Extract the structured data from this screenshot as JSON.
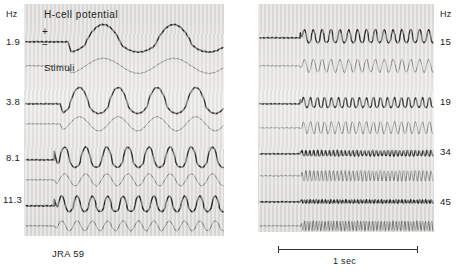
{
  "figure": {
    "title": "H-cell potential",
    "specimen_label": "JRA 59",
    "stimuli_label": "Stimuli",
    "polarity_plus": "+",
    "polarity_minus": "−",
    "scalebar_label": "1 sec"
  },
  "left_panel": {
    "axis_unit": "Hz",
    "rows": [
      {
        "hz_label": "1.9"
      },
      {
        "hz_label": "3.8"
      },
      {
        "hz_label": "8.1"
      },
      {
        "hz_label": "11.3"
      }
    ]
  },
  "right_panel": {
    "axis_unit": "Hz",
    "rows": [
      {
        "hz_label": "15"
      },
      {
        "hz_label": "19"
      },
      {
        "hz_label": "34"
      },
      {
        "hz_label": "45"
      }
    ]
  },
  "chart_data": {
    "type": "line",
    "title": "H-cell potential",
    "subtitle": "JRA 59",
    "xlabel": "time",
    "ylabel": "membrane potential / stimulus",
    "x_scalebar": {
      "label": "1 sec",
      "seconds": 1
    },
    "grid": false,
    "legend": [
      "H-cell potential (response)",
      "Stimuli"
    ],
    "legend_position": "inline-left",
    "note": "Each row is a paired recording: upper dark trace = H-cell membrane potential response, lower light trace = sinusoidal flicker stimulus. Response amplitude attenuates as stimulus frequency rises.",
    "panels": [
      {
        "name": "left",
        "axis_unit": "Hz",
        "axis_side": "left",
        "series": [
          {
            "name": "1.9 Hz response",
            "frequency_hz": 1.9,
            "role": "response",
            "relative_amplitude": 1.0,
            "cycles_visible": 2.2
          },
          {
            "name": "1.9 Hz stimulus",
            "frequency_hz": 1.9,
            "role": "stimulus",
            "relative_amplitude": 0.42,
            "cycles_visible": 2.2
          },
          {
            "name": "3.8 Hz response",
            "frequency_hz": 3.8,
            "role": "response",
            "relative_amplitude": 0.92,
            "cycles_visible": 4.2
          },
          {
            "name": "3.8 Hz stimulus",
            "frequency_hz": 3.8,
            "role": "stimulus",
            "relative_amplitude": 0.4,
            "cycles_visible": 4.2
          },
          {
            "name": "8.1 Hz response",
            "frequency_hz": 8.1,
            "role": "response",
            "relative_amplitude": 0.74,
            "cycles_visible": 8.0
          },
          {
            "name": "8.1 Hz stimulus",
            "frequency_hz": 8.1,
            "role": "stimulus",
            "relative_amplitude": 0.38,
            "cycles_visible": 8.0
          },
          {
            "name": "11.3 Hz response",
            "frequency_hz": 11.3,
            "role": "response",
            "relative_amplitude": 0.58,
            "cycles_visible": 11.0
          },
          {
            "name": "11.3 Hz stimulus",
            "frequency_hz": 11.3,
            "role": "stimulus",
            "relative_amplitude": 0.34,
            "cycles_visible": 11.0
          }
        ]
      },
      {
        "name": "right",
        "axis_unit": "Hz",
        "axis_side": "right",
        "series": [
          {
            "name": "15 Hz response",
            "frequency_hz": 15,
            "role": "response",
            "relative_amplitude": 0.4,
            "cycles_visible": 15
          },
          {
            "name": "15 Hz stimulus",
            "frequency_hz": 15,
            "role": "stimulus",
            "relative_amplitude": 0.34,
            "cycles_visible": 15
          },
          {
            "name": "19 Hz response",
            "frequency_hz": 19,
            "role": "response",
            "relative_amplitude": 0.3,
            "cycles_visible": 19
          },
          {
            "name": "19 Hz stimulus",
            "frequency_hz": 19,
            "role": "stimulus",
            "relative_amplitude": 0.32,
            "cycles_visible": 19
          },
          {
            "name": "34 Hz response",
            "frequency_hz": 34,
            "role": "response",
            "relative_amplitude": 0.16,
            "cycles_visible": 34
          },
          {
            "name": "34 Hz stimulus",
            "frequency_hz": 34,
            "role": "stimulus",
            "relative_amplitude": 0.28,
            "cycles_visible": 34
          },
          {
            "name": "45 Hz response",
            "frequency_hz": 45,
            "role": "response",
            "relative_amplitude": 0.09,
            "cycles_visible": 45
          },
          {
            "name": "45 Hz stimulus",
            "frequency_hz": 45,
            "role": "stimulus",
            "relative_amplitude": 0.26,
            "cycles_visible": 45
          }
        ]
      }
    ]
  }
}
